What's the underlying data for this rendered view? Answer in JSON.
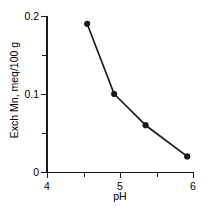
{
  "chart_data": {
    "type": "line",
    "title": "",
    "xlabel": "pH",
    "ylabel": "Exch Mn, meq/100 g",
    "xlim": [
      4,
      6
    ],
    "ylim": [
      0,
      0.2
    ],
    "grid": false,
    "legend": null,
    "marker": "filled-circle",
    "line_color": "#1a1a1a",
    "marker_color": "#1a1a1a",
    "x": [
      4.55,
      4.92,
      5.35,
      5.92
    ],
    "values": [
      0.19,
      0.1,
      0.06,
      0.02
    ],
    "points": [
      {
        "x": 4.55,
        "y": 0.19
      },
      {
        "x": 4.92,
        "y": 0.1
      },
      {
        "x": 5.35,
        "y": 0.06
      },
      {
        "x": 5.92,
        "y": 0.02
      }
    ],
    "x_ticks": [
      {
        "value": 4,
        "label": "4",
        "major": true
      },
      {
        "value": 4.5,
        "label": "",
        "major": false
      },
      {
        "value": 5,
        "label": "5",
        "major": true
      },
      {
        "value": 5.5,
        "label": "",
        "major": false
      },
      {
        "value": 6,
        "label": "6",
        "major": true
      }
    ],
    "y_ticks": [
      {
        "value": 0,
        "label": "0",
        "major": true
      },
      {
        "value": 0.05,
        "label": "",
        "major": false
      },
      {
        "value": 0.1,
        "label": "0.1",
        "major": true
      },
      {
        "value": 0.15,
        "label": "",
        "major": false
      },
      {
        "value": 0.2,
        "label": "0.2",
        "major": true
      }
    ]
  }
}
